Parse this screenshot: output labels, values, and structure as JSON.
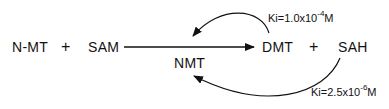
{
  "reaction": {
    "substrate_1": "N-MT",
    "plus_1": "+",
    "substrate_2": "SAM",
    "enzyme": "NMT",
    "product_1": "DMT",
    "plus_2": "+",
    "product_2": "SAH"
  },
  "inhibition": [
    {
      "inhibitor": "DMT",
      "prefix": "Ki=1.0x10",
      "exponent": "-4",
      "unit": "M"
    },
    {
      "inhibitor": "SAH",
      "prefix": "Ki=2.5x10",
      "exponent": "-6",
      "unit": "M"
    }
  ],
  "colors": {
    "ink": "#111111",
    "background": "#ffffff"
  }
}
